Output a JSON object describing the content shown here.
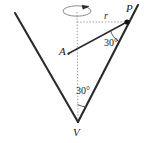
{
  "figure": {
    "background_color": "#ffffff",
    "stroke_color": "#2b2b2b",
    "dotted_color": "#9a9a9a",
    "labels": {
      "apex": "V",
      "point_on_rim": "P",
      "axis_point": "A",
      "radius": "r",
      "angle_at_P": "30°",
      "angle_at_V": "30°"
    },
    "icons": {
      "rotation": "rotation-arrow-icon",
      "point_marker": "point-marker-icon"
    },
    "geometry": {
      "apex_V": [
        78,
        122
      ],
      "point_P": [
        127,
        22
      ],
      "point_A": [
        68,
        54
      ],
      "axis_top": [
        77,
        13
      ],
      "left_slant_top": [
        15,
        13
      ],
      "right_slant_top": [
        138,
        5
      ],
      "radius_line": [
        [
          77,
          22
        ],
        [
          127,
          22
        ]
      ],
      "angle_values_deg": [
        30,
        30
      ]
    }
  }
}
